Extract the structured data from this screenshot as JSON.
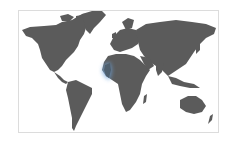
{
  "map": {
    "type": "world-choropleth",
    "land_color": "#5b5b5b",
    "background_color": "#ffffff",
    "border_color": "#dcdcdc",
    "highlight": {
      "region": "West Africa (Senegal / Gambia / Guinea-Bissau coast)",
      "color": "#6fa3d8",
      "style": "blue glow outline"
    }
  }
}
